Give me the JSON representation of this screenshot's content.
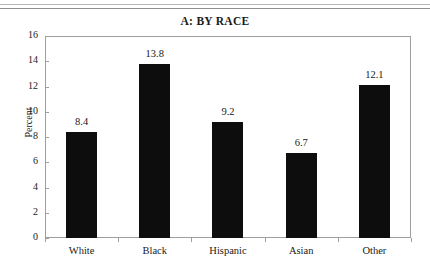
{
  "figure": {
    "title": "A: BY RACE",
    "rules_visible": true
  },
  "chart_data": {
    "type": "bar",
    "title": "A: BY RACE",
    "categories": [
      "White",
      "Black",
      "Hispanic",
      "Asian",
      "Other"
    ],
    "values": [
      8.4,
      13.8,
      9.2,
      6.7,
      12.1
    ],
    "value_labels": [
      "8.4",
      "13.8",
      "9.2",
      "6.7",
      "12.1"
    ],
    "xlabel": "",
    "ylabel": "Percent",
    "ylim": [
      0,
      16
    ],
    "ytick_step": 2,
    "yticks": [
      0,
      2,
      4,
      6,
      8,
      10,
      12,
      14,
      16
    ],
    "ytick_labels": [
      "0",
      "2",
      "4",
      "6",
      "8",
      "10",
      "12",
      "14",
      "16"
    ],
    "grid": false,
    "legend": null,
    "bar_color": "#0d0d0d",
    "frame_color": "#9e9e9e",
    "background": "#ffffff"
  }
}
